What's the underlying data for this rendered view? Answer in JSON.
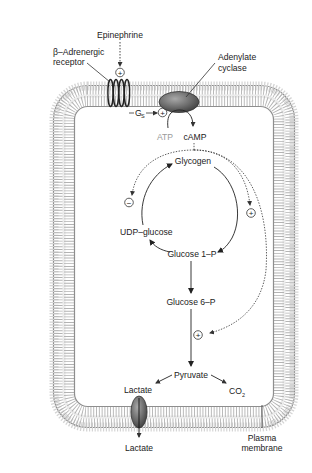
{
  "colors": {
    "background": "#ffffff",
    "membrane_dark": "#8a8a8a",
    "membrane_light": "#d9d9d9",
    "protein": "#6f6f6f",
    "text": "#222222",
    "faded_text": "#9a9a9a"
  },
  "labels": {
    "epinephrine": "Epinephrine",
    "receptor_line1": "β–Adrenergic",
    "receptor_line2": "receptor",
    "cyclase_line1": "Adenylate",
    "cyclase_line2": "cyclase",
    "gs": "G",
    "gs_sub": "S",
    "atp": "ATP",
    "camp": "cAMP",
    "glycogen": "Glycogen",
    "udp_glucose": "UDP–glucose",
    "glucose1p": "Glucose 1–P",
    "glucose6p": "Glucose 6–P",
    "pyruvate": "Pyruvate",
    "lactate_inside": "Lactate",
    "co2": "CO",
    "co2_sub": "2",
    "lactate_outside": "Lactate",
    "membrane_line1": "Plasma",
    "membrane_line2": "membrane"
  },
  "regulation_marks": {
    "epinephrine_receptor": "+",
    "gs_cyclase": "+",
    "synthesis_inhibit": "−",
    "breakdown_activate": "+",
    "glycolysis_activate": "+"
  },
  "pathway": {
    "nodes": [
      "Epinephrine",
      "β–Adrenergic receptor",
      "Gs",
      "Adenylate cyclase",
      "ATP",
      "cAMP",
      "Glycogen",
      "Glucose 1–P",
      "UDP–glucose",
      "Glucose 6–P",
      "Pyruvate",
      "Lactate",
      "CO2"
    ],
    "edges": [
      {
        "from": "Epinephrine",
        "to": "β–Adrenergic receptor",
        "type": "activate"
      },
      {
        "from": "Gs",
        "to": "Adenylate cyclase",
        "type": "activate"
      },
      {
        "from": "ATP",
        "to": "cAMP",
        "type": "conversion"
      },
      {
        "from": "cAMP",
        "to": "Glycogen synthesis",
        "type": "inhibit"
      },
      {
        "from": "cAMP",
        "to": "Glycogen breakdown",
        "type": "activate"
      },
      {
        "from": "cAMP",
        "to": "Glycolysis",
        "type": "activate"
      },
      {
        "from": "Glycogen",
        "to": "Glucose 1–P",
        "type": "conversion"
      },
      {
        "from": "Glucose 1–P",
        "to": "UDP–glucose",
        "type": "conversion"
      },
      {
        "from": "UDP–glucose",
        "to": "Glycogen",
        "type": "conversion"
      },
      {
        "from": "Glucose 1–P",
        "to": "Glucose 6–P",
        "type": "conversion"
      },
      {
        "from": "Glucose 6–P",
        "to": "Pyruvate",
        "type": "conversion"
      },
      {
        "from": "Pyruvate",
        "to": "Lactate",
        "type": "conversion"
      },
      {
        "from": "Pyruvate",
        "to": "CO2",
        "type": "conversion"
      },
      {
        "from": "Lactate",
        "to": "Lactate (extracellular)",
        "type": "transport"
      }
    ]
  }
}
